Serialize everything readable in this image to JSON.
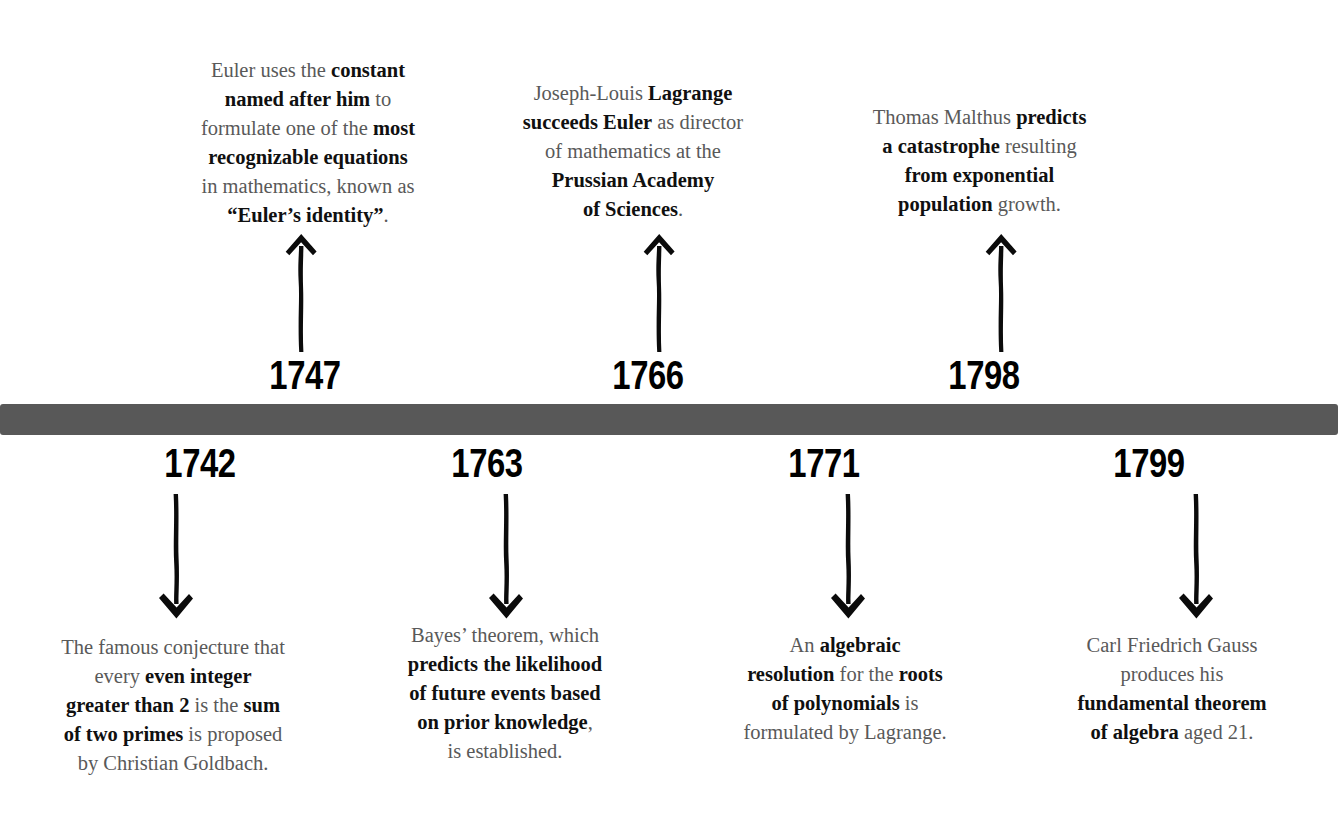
{
  "meta": {
    "bar_color": "#585858",
    "body_text_color": "#595959",
    "emphasis_text_color": "#101010",
    "background_color": "#ffffff"
  },
  "events": [
    {
      "id": "1742-goldbach",
      "year": "1742",
      "side": "below",
      "arrow": "down-arrow-icon",
      "lines": [
        [
          {
            "t": "The famous conjecture that",
            "b": false
          }
        ],
        [
          {
            "t": "every ",
            "b": false
          },
          {
            "t": "even integer",
            "b": true
          }
        ],
        [
          {
            "t": "greater than 2",
            "b": true
          },
          {
            "t": " is the ",
            "b": false
          },
          {
            "t": "sum",
            "b": true
          }
        ],
        [
          {
            "t": "of two primes",
            "b": true
          },
          {
            "t": " is proposed",
            "b": false
          }
        ],
        [
          {
            "t": "by Christian Goldbach.",
            "b": false
          }
        ]
      ]
    },
    {
      "id": "1747-euler-identity",
      "year": "1747",
      "side": "above",
      "arrow": "up-arrow-icon",
      "lines": [
        [
          {
            "t": "Euler uses the ",
            "b": false
          },
          {
            "t": "constant",
            "b": true
          }
        ],
        [
          {
            "t": "named after him",
            "b": true
          },
          {
            "t": " to",
            "b": false
          }
        ],
        [
          {
            "t": "formulate one of the ",
            "b": false
          },
          {
            "t": "most",
            "b": true
          }
        ],
        [
          {
            "t": "recognizable equations",
            "b": true
          }
        ],
        [
          {
            "t": "in mathematics, known as",
            "b": false
          }
        ],
        [
          {
            "t": "“Euler’s identity”",
            "b": true
          },
          {
            "t": ".",
            "b": false
          }
        ]
      ]
    },
    {
      "id": "1763-bayes",
      "year": "1763",
      "side": "below",
      "arrow": "down-arrow-icon",
      "lines": [
        [
          {
            "t": "Bayes’ theorem, which",
            "b": false
          }
        ],
        [
          {
            "t": "predicts the likelihood",
            "b": true
          }
        ],
        [
          {
            "t": "of future events based",
            "b": true
          }
        ],
        [
          {
            "t": "on prior knowledge",
            "b": true
          },
          {
            "t": ",",
            "b": false
          }
        ],
        [
          {
            "t": "is established.",
            "b": false
          }
        ]
      ]
    },
    {
      "id": "1766-lagrange",
      "year": "1766",
      "side": "above",
      "arrow": "up-arrow-icon",
      "lines": [
        [
          {
            "t": "Joseph-Louis ",
            "b": false
          },
          {
            "t": "Lagrange",
            "b": true
          }
        ],
        [
          {
            "t": "succeeds Euler",
            "b": true
          },
          {
            "t": " as director",
            "b": false
          }
        ],
        [
          {
            "t": "of mathematics at the",
            "b": false
          }
        ],
        [
          {
            "t": "Prussian Academy",
            "b": true
          }
        ],
        [
          {
            "t": "of Sciences",
            "b": true
          },
          {
            "t": ".",
            "b": false
          }
        ]
      ]
    },
    {
      "id": "1771-polynomials",
      "year": "1771",
      "side": "below",
      "arrow": "down-arrow-icon",
      "lines": [
        [
          {
            "t": "An ",
            "b": false
          },
          {
            "t": "algebraic",
            "b": true
          }
        ],
        [
          {
            "t": "resolution",
            "b": true
          },
          {
            "t": " for the ",
            "b": false
          },
          {
            "t": "roots",
            "b": true
          }
        ],
        [
          {
            "t": "of polynomials",
            "b": true
          },
          {
            "t": " is",
            "b": false
          }
        ],
        [
          {
            "t": "formulated by Lagrange.",
            "b": false
          }
        ]
      ]
    },
    {
      "id": "1798-malthus",
      "year": "1798",
      "side": "above",
      "arrow": "up-arrow-icon",
      "lines": [
        [
          {
            "t": "Thomas Malthus ",
            "b": false
          },
          {
            "t": "predicts",
            "b": true
          }
        ],
        [
          {
            "t": "a catastrophe",
            "b": true
          },
          {
            "t": " resulting",
            "b": false
          }
        ],
        [
          {
            "t": "from exponential",
            "b": true
          }
        ],
        [
          {
            "t": "population",
            "b": true
          },
          {
            "t": " growth.",
            "b": false
          }
        ]
      ]
    },
    {
      "id": "1799-gauss",
      "year": "1799",
      "side": "below",
      "arrow": "down-arrow-icon",
      "lines": [
        [
          {
            "t": "Carl Friedrich Gauss",
            "b": false
          }
        ],
        [
          {
            "t": "produces his",
            "b": false
          }
        ],
        [
          {
            "t": "fundamental theorem",
            "b": true
          }
        ],
        [
          {
            "t": "of algebra",
            "b": true
          },
          {
            "t": " aged 21.",
            "b": false
          }
        ]
      ]
    }
  ],
  "layout": {
    "1742-goldbach": {
      "year_left": 100,
      "year_width": 200,
      "text_left": 8,
      "text_width": 330,
      "text_top": 633,
      "arrow_x": 148,
      "arrow_y": 492,
      "arrow_h": 128
    },
    "1747-euler-identity": {
      "year_left": 205,
      "year_width": 200,
      "text_left": 143,
      "text_width": 330,
      "text_top": 56,
      "arrow_x": 273,
      "arrow_y": 232,
      "arrow_h": 122
    },
    "1763-bayes": {
      "year_left": 387,
      "year_width": 200,
      "text_left": 345,
      "text_width": 320,
      "text_top": 621,
      "arrow_x": 478,
      "arrow_y": 492,
      "arrow_h": 128
    },
    "1766-lagrange": {
      "year_left": 548,
      "year_width": 200,
      "text_left": 478,
      "text_width": 310,
      "text_top": 79,
      "arrow_x": 631,
      "arrow_y": 232,
      "arrow_h": 122
    },
    "1771-polynomials": {
      "year_left": 724,
      "year_width": 200,
      "text_left": 685,
      "text_width": 320,
      "text_top": 631,
      "arrow_x": 820,
      "arrow_y": 492,
      "arrow_h": 128
    },
    "1798-malthus": {
      "year_left": 884,
      "year_width": 200,
      "text_left": 822,
      "text_width": 315,
      "text_top": 103,
      "arrow_x": 973,
      "arrow_y": 232,
      "arrow_h": 122
    },
    "1799-gauss": {
      "year_left": 1049,
      "year_width": 200,
      "text_left": 1012,
      "text_width": 320,
      "text_top": 631,
      "arrow_x": 1168,
      "arrow_y": 492,
      "arrow_h": 128
    }
  }
}
